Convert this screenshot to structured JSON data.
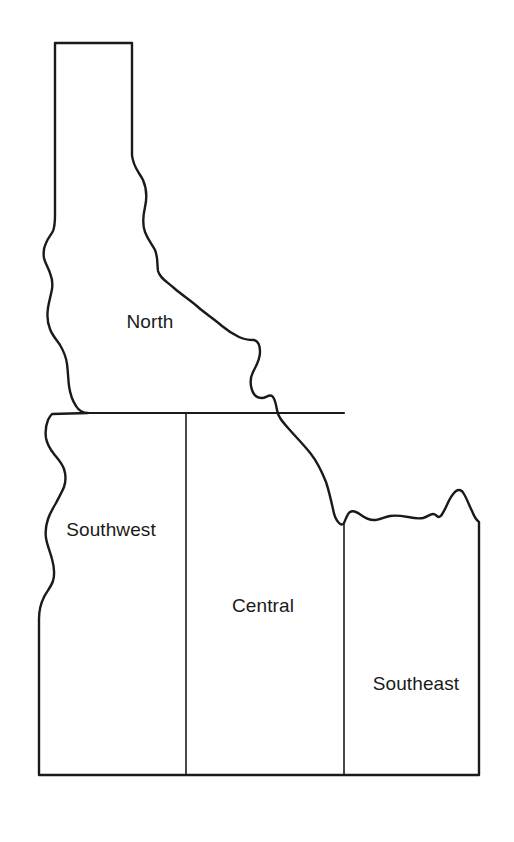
{
  "map": {
    "title": "Idaho Regions Outline Map",
    "subject": "Idaho",
    "style": {
      "background_color": "#ffffff",
      "outline_color": "#1a1a1a",
      "fill_color": "#ffffff",
      "label_color": "#1a1a1a",
      "outline_width_px": 2.4,
      "divider_width_px": 1.6
    },
    "regions": [
      {
        "id": "north",
        "label": "North",
        "label_x": 150,
        "label_y": 322,
        "icon": "region-area"
      },
      {
        "id": "southwest",
        "label": "Southwest",
        "label_x": 111,
        "label_y": 530,
        "icon": "region-area"
      },
      {
        "id": "central",
        "label": "Central",
        "label_x": 263,
        "label_y": 606,
        "icon": "region-area"
      },
      {
        "id": "southeast",
        "label": "Southeast",
        "label_x": 416,
        "label_y": 684,
        "icon": "region-area"
      }
    ],
    "boundaries": {
      "state_outline_path": "M 55,43 L 132,43 L 132,155 C 133,167 139,172 143,180 C 147,189 147,198 145,207 C 143,216 142,224 145,232 C 148,240 152,244 155,250 C 158,257 157,264 158,271 C 160,278 166,281 174,288 C 182,295 190,300 198,307 C 206,314 214,319 222,326 C 228,331 233,334 239,337 C 245,340 250,340 254,340 C 258,341 260,345 260,352 C 260,360 256,366 253,372 C 250,378 250,384 252,390 C 254,396 258,398 262,398 C 266,398 269,394 272,396 C 275,398 276,404 277,410 C 278,416 281,420 288,428 C 295,436 303,444 311,454 C 318,463 322,472 326,482 C 329,491 331,500 333,509 C 334,515 336,520 339,523 C 341,525 343,525 344,523 C 346,519 347,514 350,512 C 353,510 357,512 361,515 C 365,518 369,520 374,520 C 379,520 384,517 390,516 C 396,515 402,516 408,517 C 413,518 418,519 423,518 C 427,517 430,514 433,514 C 436,514 437,517 439,517 C 441,517 443,513 446,507 C 449,500 452,494 456,491 C 459,489 462,490 464,494 C 467,499 469,505 472,511 C 474,516 476,520 479,522 L 479,775 L 39,775 L 39,619 C 39,610 41,603 44,597 C 47,591 51,587 53,581 C 55,574 54,566 52,559 C 50,551 47,545 46,538 C 45,531 46,525 48,519 C 50,513 53,508 56,503 C 59,497 62,492 64,487 C 66,481 66,475 64,469 C 62,463 58,459 54,454 C 50,449 47,444 46,438 C 45,431 46,425 48,420 C 50,416 52,414 52,414 L 88,413 L 88,413 C 83,413 79,411 76,406 C 72,400 70,393 69,386 C 68,378 68,371 67,364 C 66,356 63,350 60,345 C 56,339 52,335 50,329 C 47,322 47,315 48,308 C 49,301 51,295 52,289 C 53,283 52,278 50,273 C 48,267 45,263 44,258 C 43,252 44,247 46,243 C 48,238 51,235 53,231 C 55,226 55,221 55,215 L 55,43 Z",
      "dividers": [
        {
          "id": "north-south-divider",
          "path": "M 88,413 L 344,413"
        },
        {
          "id": "southwest-central-divider",
          "path": "M 186,413 L 186,775"
        },
        {
          "id": "central-southeast-divider",
          "path": "M 344,524 L 344,775"
        }
      ]
    }
  }
}
